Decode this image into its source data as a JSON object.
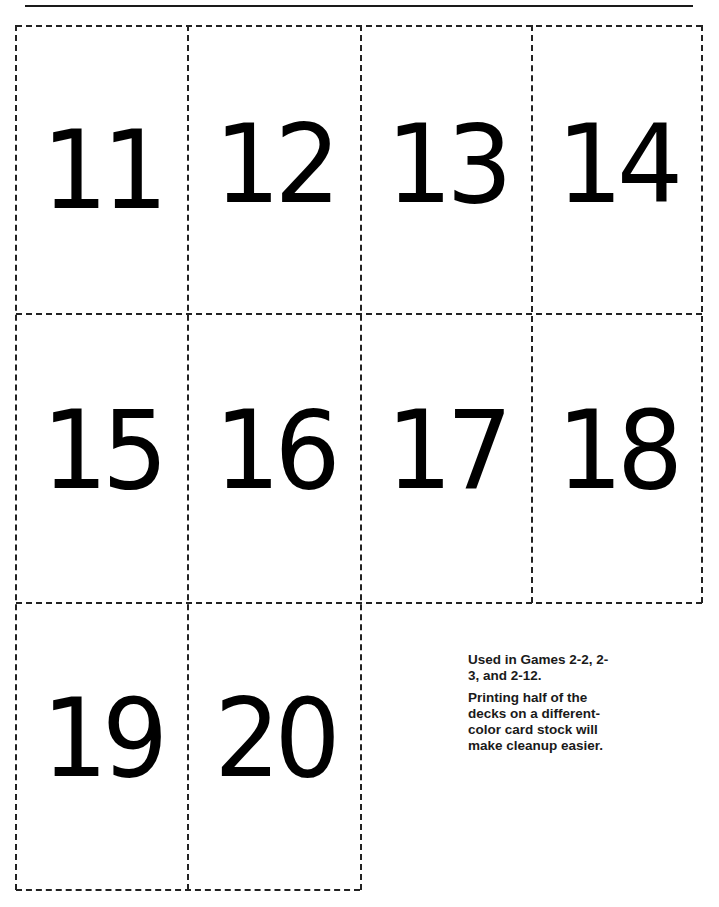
{
  "page": {
    "type": "printable number cards",
    "cards": [
      {
        "label": "11"
      },
      {
        "label": "12"
      },
      {
        "label": "13"
      },
      {
        "label": "14"
      },
      {
        "label": "15"
      },
      {
        "label": "16"
      },
      {
        "label": "17"
      },
      {
        "label": "18"
      },
      {
        "label": "19"
      },
      {
        "label": "20"
      }
    ],
    "note": {
      "line1": "Used in Games 2-2, 2-3, and 2-12.",
      "line2": "Printing half of the decks on a different-color card stock will make cleanup easier."
    }
  }
}
